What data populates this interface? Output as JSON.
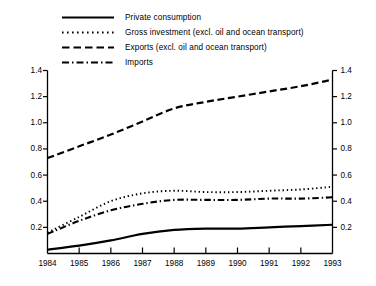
{
  "chart_data": {
    "type": "line",
    "title": "",
    "subtitle": "",
    "xlabel": "",
    "ylabel": "",
    "x": [
      1984,
      1985,
      1986,
      1987,
      1988,
      1989,
      1990,
      1991,
      1992,
      1993
    ],
    "xtick_labels": [
      "1984",
      "1985",
      "1986",
      "1987",
      "1988",
      "1989",
      "1990",
      "1991",
      "1992",
      "1993"
    ],
    "ytick_labels": [
      "0.2",
      "0.4",
      "0.6",
      "0.8",
      "1.0",
      "1.2",
      "1.4"
    ],
    "ytick_values": [
      0.2,
      0.4,
      0.6,
      0.8,
      1.0,
      1.2,
      1.4
    ],
    "ylim": [
      0.0,
      1.4
    ],
    "xlim": [
      1984,
      1993
    ],
    "grid": false,
    "legend_position": "top-left",
    "dual_y_axis": true,
    "series": [
      {
        "name": "Private consumption",
        "line_style": "solid",
        "values": [
          0.03,
          0.06,
          0.1,
          0.15,
          0.18,
          0.19,
          0.19,
          0.2,
          0.21,
          0.22
        ]
      },
      {
        "name": "Gross investment (excl. oil and ocean transport)",
        "line_style": "dotted",
        "values": [
          0.16,
          0.28,
          0.4,
          0.46,
          0.48,
          0.47,
          0.47,
          0.48,
          0.49,
          0.51
        ]
      },
      {
        "name": "Exports (excl. oil and ocean transport)",
        "line_style": "dashed",
        "values": [
          0.73,
          0.82,
          0.91,
          1.01,
          1.11,
          1.16,
          1.2,
          1.24,
          1.28,
          1.33
        ]
      },
      {
        "name": "Imports",
        "line_style": "dash-dot",
        "values": [
          0.15,
          0.25,
          0.33,
          0.38,
          0.41,
          0.41,
          0.41,
          0.42,
          0.42,
          0.43
        ]
      }
    ]
  },
  "legend": {
    "items": [
      {
        "label": "Private consumption",
        "style": "solid"
      },
      {
        "label": "Gross investment (excl. oil and ocean transport)",
        "style": "dotted"
      },
      {
        "label": "Exports (excl. oil and ocean transport)",
        "style": "dashed"
      },
      {
        "label": "Imports",
        "style": "dash-dot"
      }
    ]
  },
  "colors": {
    "line": "#000000",
    "axis": "#000000",
    "background": "#ffffff"
  }
}
